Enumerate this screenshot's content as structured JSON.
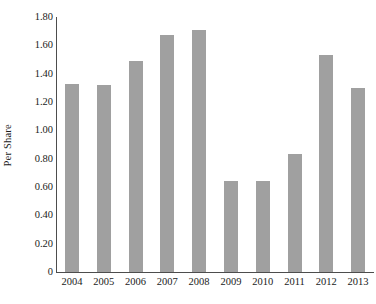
{
  "chart_data": {
    "type": "bar",
    "title": "",
    "subtitle": "",
    "xlabel": "",
    "ylabel": "Per Share",
    "categories": [
      "2004",
      "2005",
      "2006",
      "2007",
      "2008",
      "2009",
      "2010",
      "2011",
      "2012",
      "2013"
    ],
    "values": [
      1.33,
      1.32,
      1.49,
      1.67,
      1.71,
      0.64,
      0.64,
      0.83,
      1.53,
      1.3
    ],
    "series": [
      {
        "name": "Per Share",
        "values": [
          1.33,
          1.32,
          1.49,
          1.67,
          1.71,
          0.64,
          0.64,
          0.83,
          1.53,
          1.3
        ]
      }
    ],
    "ylim": [
      0,
      1.8
    ],
    "ytick_labels": [
      "1.80",
      "1.60",
      "1.40",
      "1.20",
      "1.00",
      "0.80",
      "0.60",
      "0.40",
      "0.20",
      "0"
    ],
    "ytick_values": [
      1.8,
      1.6,
      1.4,
      1.2,
      1.0,
      0.8,
      0.6,
      0.4,
      0.2,
      0
    ],
    "grid": false,
    "legend": false,
    "legend_position": "none",
    "bar_color": "#a0a0a0",
    "axis_color": "#4d4d4d"
  }
}
